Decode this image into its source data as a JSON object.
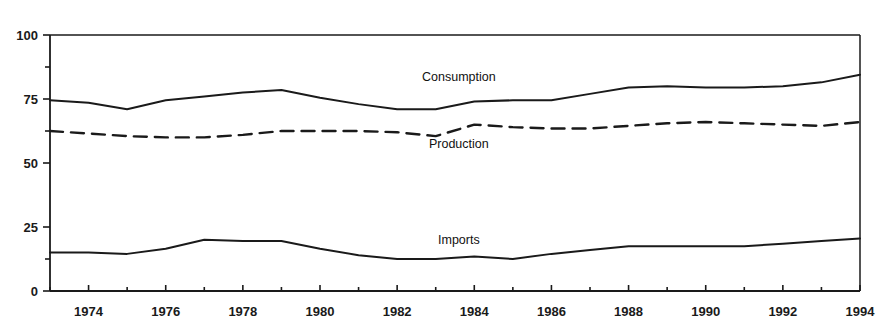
{
  "chart_data": {
    "type": "line",
    "title": "",
    "subtitle": "",
    "xlabel": "",
    "ylabel": "",
    "xlim": [
      1973,
      1994
    ],
    "ylim": [
      0,
      100
    ],
    "grid": false,
    "legend_position": "inline-annotations",
    "x": [
      1973,
      1974,
      1975,
      1976,
      1977,
      1978,
      1979,
      1980,
      1981,
      1982,
      1983,
      1984,
      1985,
      1986,
      1987,
      1988,
      1989,
      1990,
      1991,
      1992,
      1993,
      1994
    ],
    "xticks": [
      1974,
      1976,
      1978,
      1980,
      1982,
      1984,
      1986,
      1988,
      1990,
      1992,
      1994
    ],
    "xtick_labels": [
      "1974",
      "1976",
      "1978",
      "1980",
      "1982",
      "1984",
      "1986",
      "1988",
      "1990",
      "1992",
      "1994"
    ],
    "xminorticks": [
      1973,
      1975,
      1977,
      1979,
      1981,
      1983,
      1985,
      1987,
      1989,
      1991,
      1993
    ],
    "yticks": [
      0,
      25,
      50,
      75,
      100
    ],
    "ytick_labels": [
      "0",
      "25",
      "50",
      "75",
      "100"
    ],
    "yminorticks": [
      12.5,
      62.5,
      87.5
    ],
    "series": [
      {
        "name": "Consumption",
        "style": "solid",
        "color": "#1a1a1a",
        "label_x": 1983.6,
        "label_y": 82,
        "values": [
          74.5,
          73.5,
          71.0,
          74.5,
          76.0,
          77.5,
          78.5,
          75.5,
          73.0,
          71.0,
          71.0,
          74.0,
          74.5,
          74.5,
          77.0,
          79.5,
          80.0,
          79.5,
          79.5,
          80.0,
          81.5,
          84.5
        ]
      },
      {
        "name": "Production",
        "style": "dashed",
        "color": "#1a1a1a",
        "label_x": 1983.6,
        "label_y": 56,
        "values": [
          62.5,
          61.5,
          60.5,
          60.0,
          60.0,
          61.0,
          62.5,
          62.5,
          62.5,
          62.0,
          60.5,
          65.0,
          64.0,
          63.5,
          63.5,
          64.5,
          65.5,
          66.0,
          65.5,
          65.0,
          64.5,
          66.0
        ]
      },
      {
        "name": "Imports",
        "style": "solid",
        "color": "#1a1a1a",
        "label_x": 1983.6,
        "label_y": 18.5,
        "values": [
          15.0,
          15.0,
          14.5,
          16.5,
          20.0,
          19.5,
          19.5,
          16.5,
          14.0,
          12.5,
          12.5,
          13.5,
          12.5,
          14.5,
          16.0,
          17.5,
          17.5,
          17.5,
          17.5,
          18.5,
          19.5,
          20.5
        ]
      }
    ]
  }
}
